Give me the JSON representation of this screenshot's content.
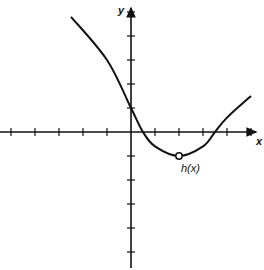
{
  "chart_data": {
    "type": "line",
    "title": "",
    "xlabel": "x",
    "ylabel": "y",
    "series": [
      {
        "name": "h(x)",
        "points": [
          [
            -2.5,
            4.8
          ],
          [
            -1,
            3.0
          ],
          [
            0,
            1.0
          ],
          [
            0.5,
            0
          ],
          [
            1,
            -0.6
          ],
          [
            2,
            -1.0
          ],
          [
            3,
            -0.6
          ],
          [
            3.5,
            0
          ],
          [
            4,
            0.6
          ],
          [
            5,
            1.5
          ]
        ],
        "open_point": [
          2,
          -1
        ],
        "label": "h(x)"
      }
    ],
    "x_ticks": [
      -5,
      -4,
      -3,
      -2,
      -1,
      1,
      2,
      3,
      4,
      5
    ],
    "y_ticks": [
      -5,
      -4,
      -3,
      -2,
      -1,
      1,
      2,
      3,
      4,
      5
    ],
    "xlim": [
      -5.4,
      5.5
    ],
    "ylim": [
      -5.5,
      5.4
    ],
    "grid": false,
    "tick_labels_shown": false
  },
  "axes": {
    "x_label": "x",
    "y_label": "y"
  },
  "curve_label": "h(x)"
}
